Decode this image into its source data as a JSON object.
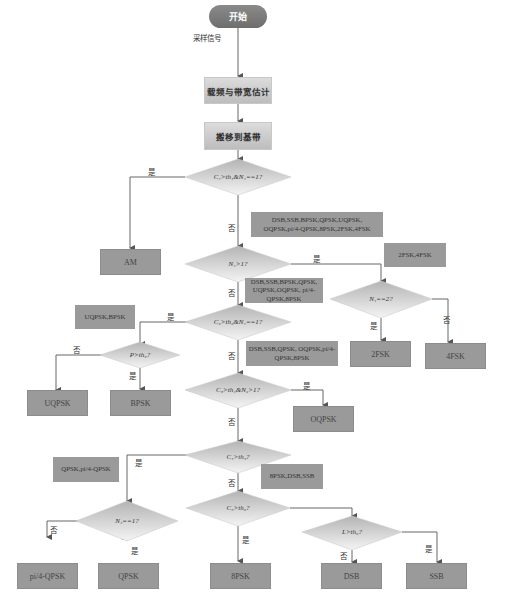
{
  "start": {
    "label": "开始"
  },
  "input_label": "采样信号",
  "steps": [
    {
      "id": "carrier",
      "label": "载频与带宽估计"
    },
    {
      "id": "baseband",
      "label": "搬移到基带"
    }
  ],
  "decisions": [
    {
      "id": "d1",
      "label": "C₁>th₁&N₁==1?"
    },
    {
      "id": "d2",
      "label": "N₁>1?"
    },
    {
      "id": "d3",
      "label": "N₁==2?"
    },
    {
      "id": "d4",
      "label": "C₂>th₂&N₁==1?"
    },
    {
      "id": "d5",
      "label": "P>th₃?"
    },
    {
      "id": "d6",
      "label": "C₃>th₄&N₂>1?"
    },
    {
      "id": "d7",
      "label": "C₄>th₅?"
    },
    {
      "id": "d8",
      "label": "N₄==1?"
    },
    {
      "id": "d9",
      "label": "C₅>th₆?"
    },
    {
      "id": "d10",
      "label": "L>th₆?"
    }
  ],
  "results": [
    {
      "id": "am",
      "label": "AM"
    },
    {
      "id": "2fsk",
      "label": "2FSK"
    },
    {
      "id": "4fsk",
      "label": "4FSK"
    },
    {
      "id": "uqpsk",
      "label": "UQPSK"
    },
    {
      "id": "bpsk",
      "label": "BPSK"
    },
    {
      "id": "oqpsk",
      "label": "OQPSK"
    },
    {
      "id": "pi4qpsk",
      "label": "pi/4-QPSK"
    },
    {
      "id": "qpsk",
      "label": "QPSK"
    },
    {
      "id": "8psk",
      "label": "8PSK"
    },
    {
      "id": "dsb",
      "label": "DSB"
    },
    {
      "id": "ssb",
      "label": "SSB"
    }
  ],
  "notes": [
    {
      "id": "n1",
      "label": "DSB,SSB,BPSK,QPSK,UQPSK, OQPSK,pi/4-QPSK,8PSK,2FSK,4FSK"
    },
    {
      "id": "n2",
      "label": "2FSK,4FSK"
    },
    {
      "id": "n3",
      "label": "DSB,SSB,BPSK,QPSK, UQPSK,OQPSK, pi/4-QPSK,8PSK"
    },
    {
      "id": "n4",
      "label": "UQPSK,BPSK"
    },
    {
      "id": "n5",
      "label": "DSB,SSB,QPSK, OQPSK,pi/4-QPSK,8PSK"
    },
    {
      "id": "n6",
      "label": "QPSK,pi/4-QPSK"
    },
    {
      "id": "n7",
      "label": "8PSK,DSB,SSB"
    }
  ],
  "edge_labels": {
    "yes": "是",
    "no": "否"
  }
}
